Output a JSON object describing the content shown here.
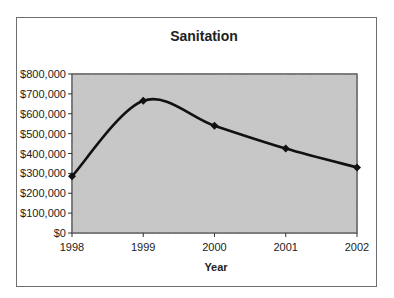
{
  "chart_data": {
    "type": "line",
    "title": "Sanitation",
    "xlabel": "Year",
    "ylabel": "",
    "categories": [
      "1998",
      "1999",
      "2000",
      "2001",
      "2002"
    ],
    "series": [
      {
        "name": "Sanitation",
        "values": [
          285000,
          665000,
          540000,
          425000,
          330000
        ],
        "color": "#111111",
        "smoothed": true
      }
    ],
    "ylim": [
      0,
      800000
    ],
    "yticks": [
      0,
      100000,
      200000,
      300000,
      400000,
      500000,
      600000,
      700000,
      800000
    ],
    "ytick_labels": [
      "$0",
      "$100,000",
      "$200,000",
      "$300,000",
      "$400,000",
      "$500,000",
      "$600,000",
      "$700,000",
      "$800,000"
    ],
    "grid": false,
    "legend": "none",
    "plot_background": "gray textured"
  }
}
